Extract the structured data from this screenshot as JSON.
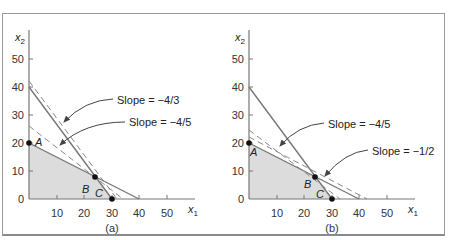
{
  "figure": {
    "panels": [
      {
        "id": "a",
        "caption": "(a)",
        "x_label": "x",
        "x_sub": "1",
        "y_label": "x",
        "y_sub": "2",
        "x_ticks": [
          "10",
          "20",
          "30",
          "40",
          "50"
        ],
        "y_ticks": [
          "0",
          "10",
          "20",
          "30",
          "40",
          "50"
        ],
        "points": [
          {
            "label": "A",
            "x": 0,
            "y": 20
          },
          {
            "label": "B",
            "x": 24,
            "y": 8
          },
          {
            "label": "C",
            "x": 30,
            "y": 0
          }
        ],
        "annotations": [
          "Slope = −4/3",
          "Slope = −4/5"
        ]
      },
      {
        "id": "b",
        "caption": "(b)",
        "x_label": "x",
        "x_sub": "1",
        "y_label": "x",
        "y_sub": "2",
        "x_ticks": [
          "10",
          "20",
          "30",
          "40",
          "50"
        ],
        "y_ticks": [
          "0",
          "10",
          "20",
          "30",
          "40",
          "50"
        ],
        "points": [
          {
            "label": "A",
            "x": 0,
            "y": 20
          },
          {
            "label": "B",
            "x": 24,
            "y": 8
          },
          {
            "label": "C",
            "x": 30,
            "y": 0
          }
        ],
        "annotations": [
          "Slope = −4/5",
          "Slope = −1/2"
        ]
      }
    ],
    "constraints": [
      {
        "name": "steep",
        "from": [
          0,
          40
        ],
        "to": [
          30,
          0
        ]
      },
      {
        "name": "shallow",
        "from": [
          0,
          20
        ],
        "to": [
          40,
          0
        ]
      }
    ],
    "feasible_region": [
      [
        0,
        0
      ],
      [
        0,
        20
      ],
      [
        24,
        8
      ],
      [
        30,
        0
      ]
    ],
    "objective_lines": {
      "a": [
        {
          "slope": "-4/3",
          "dashed": true
        },
        {
          "slope": "-4/5",
          "dashed": true
        }
      ],
      "b": [
        {
          "slope": "-4/5",
          "dashed": true
        },
        {
          "slope": "-1/2",
          "dashed": true
        }
      ]
    }
  }
}
